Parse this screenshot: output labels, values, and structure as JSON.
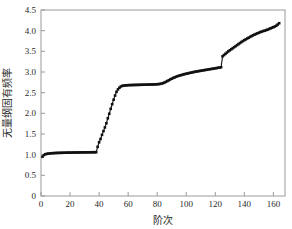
{
  "chart_data": {
    "type": "scatter",
    "title": "",
    "xlabel": "阶次",
    "ylabel": "无量纲固有频率",
    "xlim": [
      0,
      168
    ],
    "ylim": [
      0,
      4.5
    ],
    "xticks": [
      0,
      20,
      40,
      60,
      80,
      100,
      120,
      140,
      160
    ],
    "xtick_labels": [
      "0",
      "20",
      "40",
      "60",
      "80",
      "100",
      "120",
      "140",
      "160"
    ],
    "yticks": [
      0,
      0.5,
      1.0,
      1.5,
      2.0,
      2.5,
      3.0,
      3.5,
      4.0,
      4.5
    ],
    "ytick_labels": [
      "0",
      "0.5",
      "1.0",
      "1.5",
      "2.0",
      "2.5",
      "3.0",
      "3.5",
      "4.0",
      "4.5"
    ],
    "grid": false,
    "legend": null,
    "marker": "square",
    "marker_color": "#111111",
    "frame_color": "#9a9a9a",
    "series": [
      {
        "name": "无量纲固有频率",
        "x": [
          1,
          2,
          3,
          4,
          5,
          6,
          7,
          8,
          9,
          10,
          11,
          12,
          13,
          14,
          15,
          16,
          17,
          18,
          19,
          20,
          21,
          22,
          23,
          24,
          25,
          26,
          27,
          28,
          29,
          30,
          31,
          32,
          33,
          34,
          35,
          36,
          37,
          38,
          39,
          40,
          41,
          42,
          43,
          44,
          45,
          46,
          47,
          48,
          49,
          50,
          51,
          52,
          53,
          54,
          55,
          56,
          57,
          58,
          59,
          60,
          61,
          62,
          63,
          64,
          65,
          66,
          67,
          68,
          69,
          70,
          71,
          72,
          73,
          74,
          75,
          76,
          77,
          78,
          79,
          80,
          81,
          82,
          83,
          84,
          85,
          86,
          87,
          88,
          89,
          90,
          91,
          92,
          93,
          94,
          95,
          96,
          97,
          98,
          99,
          100,
          101,
          102,
          103,
          104,
          105,
          106,
          107,
          108,
          109,
          110,
          111,
          112,
          113,
          114,
          115,
          116,
          117,
          118,
          119,
          120,
          121,
          122,
          123,
          124,
          125,
          126,
          127,
          128,
          129,
          130,
          131,
          132,
          133,
          134,
          135,
          136,
          137,
          138,
          139,
          140,
          141,
          142,
          143,
          144,
          145,
          146,
          147,
          148,
          149,
          150,
          151,
          152,
          153,
          154,
          155,
          156,
          157,
          158,
          159,
          160,
          161,
          162,
          163,
          164
        ],
        "y": [
          0.95,
          0.99,
          1.01,
          1.02,
          1.025,
          1.03,
          1.033,
          1.036,
          1.038,
          1.04,
          1.042,
          1.043,
          1.044,
          1.045,
          1.046,
          1.047,
          1.048,
          1.049,
          1.05,
          1.05,
          1.051,
          1.052,
          1.052,
          1.053,
          1.053,
          1.054,
          1.054,
          1.055,
          1.055,
          1.056,
          1.056,
          1.057,
          1.057,
          1.058,
          1.058,
          1.059,
          1.059,
          1.06,
          1.19,
          1.3,
          1.38,
          1.48,
          1.57,
          1.66,
          1.76,
          1.88,
          1.99,
          2.11,
          2.22,
          2.33,
          2.43,
          2.52,
          2.58,
          2.62,
          2.65,
          2.665,
          2.672,
          2.676,
          2.679,
          2.681,
          2.683,
          2.684,
          2.685,
          2.686,
          2.687,
          2.688,
          2.689,
          2.69,
          2.691,
          2.692,
          2.693,
          2.694,
          2.695,
          2.696,
          2.697,
          2.698,
          2.699,
          2.7,
          2.702,
          2.704,
          2.707,
          2.712,
          2.72,
          2.73,
          2.745,
          2.762,
          2.781,
          2.8,
          2.82,
          2.838,
          2.855,
          2.87,
          2.885,
          2.898,
          2.91,
          2.92,
          2.93,
          2.94,
          2.95,
          2.958,
          2.966,
          2.974,
          2.982,
          2.99,
          2.998,
          3.005,
          3.012,
          3.018,
          3.024,
          3.03,
          3.036,
          3.042,
          3.048,
          3.054,
          3.06,
          3.066,
          3.072,
          3.078,
          3.084,
          3.09,
          3.096,
          3.102,
          3.108,
          3.115,
          3.38,
          3.41,
          3.44,
          3.47,
          3.5,
          3.525,
          3.55,
          3.575,
          3.6,
          3.625,
          3.65,
          3.675,
          3.7,
          3.725,
          3.748,
          3.77,
          3.79,
          3.81,
          3.83,
          3.85,
          3.87,
          3.888,
          3.905,
          3.92,
          3.935,
          3.95,
          3.965,
          3.978,
          3.99,
          4.0,
          4.012,
          4.025,
          4.04,
          4.055,
          4.07,
          4.085,
          4.1,
          4.12,
          4.15,
          4.18
        ]
      }
    ]
  }
}
